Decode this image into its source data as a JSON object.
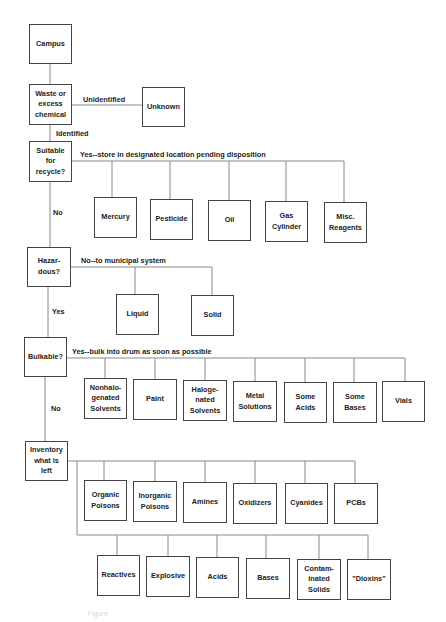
{
  "diagram": {
    "type": "flowchart",
    "nodes": {
      "campus": "Campus",
      "waste": "Waste or\nexcess\nchemical",
      "unknown": "Unknown",
      "suitable": "Suitable\nfor\nrecycle?",
      "hazardous": "Hazar-\ndous?",
      "bulkable": "Bulkable?",
      "inventory": "Inventory\nwhat is\nleft"
    },
    "edge_labels": {
      "unidentified": "Unidentified",
      "identified": "Identified",
      "recycle_yes": "Yes--store in designated location pending disposition",
      "recycle_no": "No",
      "hazardous_no": "No--to municipal system",
      "hazardous_yes": "Yes",
      "bulkable_yes": "Yes--bulk into drum as soon as possible",
      "bulkable_no": "No"
    },
    "recycle_items": [
      "Mercury",
      "Pesticide",
      "Oil",
      "Gas\nCylinder",
      "Misc.\nReagents"
    ],
    "municipal_items": [
      "Liquid",
      "Solid"
    ],
    "bulk_items": [
      "Nonhalo-\ngenated\nSolvents",
      "Paint",
      "Haloge-\nnated\nSolvents",
      "Metal\nSolutions",
      "Some\nAcids",
      "Some\nBases",
      "Vials"
    ],
    "inventory_row1": [
      "Organic\nPoisons",
      "Inorganic\nPoisons",
      "Amines",
      "Oxidizers",
      "Cyanides",
      "PCBs"
    ],
    "inventory_row2": [
      "Reactives",
      "Explosive",
      "Acids",
      "Bases",
      "Contam-\ninated\nSolids",
      "\"Dioxins\""
    ],
    "caption": "Figure"
  }
}
